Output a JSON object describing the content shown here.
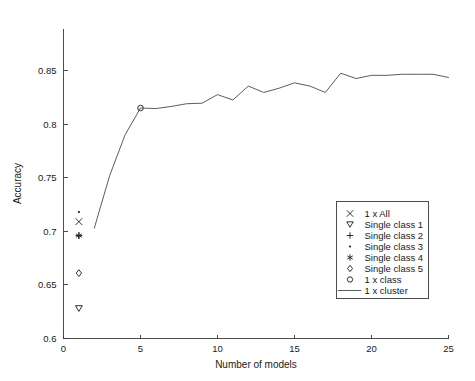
{
  "chart_data": {
    "type": "line",
    "title": "",
    "xlabel": "Number of models",
    "ylabel": "Accuracy",
    "xlim": [
      0,
      25
    ],
    "ylim": [
      0.6,
      0.87
    ],
    "xticks": [
      0,
      5,
      10,
      15,
      20,
      25
    ],
    "xticklabels": [
      "0",
      "5",
      "10",
      "15",
      "20",
      "25"
    ],
    "yticks": [
      0.6,
      0.65,
      0.7,
      0.75,
      0.8,
      0.85
    ],
    "yticklabels": [
      "0.6",
      "0.65",
      "0.7",
      "0.75",
      "0.8",
      "0.85"
    ],
    "grid": false,
    "legend_position": "lower right",
    "series": [
      {
        "name": "1 x All",
        "marker": "x",
        "style": "marker-only",
        "x": [
          1
        ],
        "values": [
          0.709
        ]
      },
      {
        "name": "Single class 1",
        "marker": "triangle-down",
        "style": "marker-only",
        "x": [
          1
        ],
        "values": [
          0.628
        ]
      },
      {
        "name": "Single class 2",
        "marker": "plus",
        "style": "marker-only",
        "x": [
          1
        ],
        "values": [
          0.696
        ]
      },
      {
        "name": "Single class 3",
        "marker": "dot",
        "style": "marker-only",
        "x": [
          1
        ],
        "values": [
          0.718
        ]
      },
      {
        "name": "Single class 4",
        "marker": "asterisk",
        "style": "marker-only",
        "x": [
          1
        ],
        "values": [
          0.696
        ]
      },
      {
        "name": "Single class 5",
        "marker": "diamond",
        "style": "marker-only",
        "x": [
          1
        ],
        "values": [
          0.661
        ]
      },
      {
        "name": "1 x class",
        "marker": "circle",
        "style": "marker-only",
        "x": [
          5
        ],
        "values": [
          0.815
        ]
      },
      {
        "name": "1 x cluster",
        "marker": "none",
        "style": "line",
        "x": [
          2,
          3,
          4,
          5,
          6,
          7,
          8,
          9,
          10,
          11,
          12,
          13,
          14,
          15,
          16,
          17,
          18,
          19,
          20,
          21,
          22,
          23,
          24,
          25
        ],
        "values": [
          0.703,
          0.752,
          0.79,
          0.815,
          0.8145,
          0.8165,
          0.819,
          0.8195,
          0.8275,
          0.8225,
          0.8355,
          0.8295,
          0.8335,
          0.8385,
          0.8355,
          0.8295,
          0.8475,
          0.8425,
          0.8455,
          0.8455,
          0.8465,
          0.8465,
          0.8465,
          0.8435
        ]
      }
    ]
  },
  "legend": {
    "entries": [
      {
        "label": "1 x All",
        "marker": "x"
      },
      {
        "label": "Single class 1",
        "marker": "triangle-down"
      },
      {
        "label": "Single class 2",
        "marker": "plus"
      },
      {
        "label": "Single class 3",
        "marker": "dot"
      },
      {
        "label": "Single class 4",
        "marker": "asterisk"
      },
      {
        "label": "Single class 5",
        "marker": "diamond"
      },
      {
        "label": "1 x class",
        "marker": "circle"
      },
      {
        "label": "1 x cluster",
        "marker": "line"
      }
    ]
  },
  "colors": {
    "line": "#4a4a4a",
    "axis": "#3a3a3a",
    "text": "#1a1a1a",
    "background": "#ffffff"
  }
}
